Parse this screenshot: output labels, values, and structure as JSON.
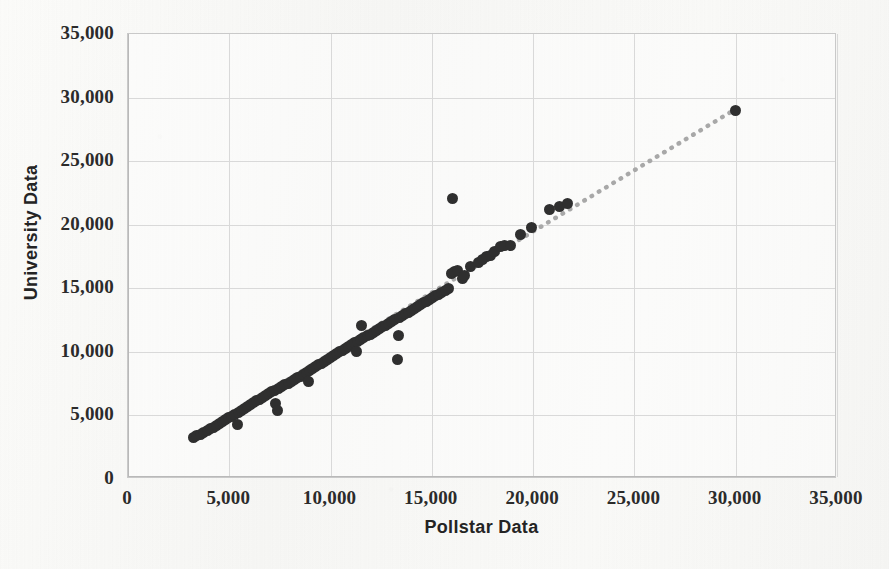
{
  "chart_data": {
    "type": "scatter",
    "title": "",
    "xlabel": "Pollstar Data",
    "ylabel": "University Data",
    "xlim": [
      0,
      35000
    ],
    "ylim": [
      0,
      35000
    ],
    "grid": true,
    "legend": null,
    "xticks": [
      0,
      5000,
      10000,
      15000,
      20000,
      25000,
      30000,
      35000
    ],
    "yticks": [
      0,
      5000,
      10000,
      15000,
      20000,
      25000,
      30000,
      35000
    ],
    "xticklabels": [
      "0",
      "5,000",
      "10,000",
      "15,000",
      "20,000",
      "25,000",
      "30,000",
      "35,000"
    ],
    "yticklabels": [
      "0",
      "5,000",
      "10,000",
      "15,000",
      "20,000",
      "25,000",
      "30,000",
      "35,000"
    ],
    "marker_color": "#2f2f2f",
    "marker_size": 11,
    "trendline": {
      "style": "dotted",
      "color": "#a8a8a8",
      "x": [
        3200,
        30000
      ],
      "y": [
        3200,
        29000
      ]
    },
    "points": [
      [
        3250,
        3300
      ],
      [
        3400,
        3400
      ],
      [
        3600,
        3500
      ],
      [
        3750,
        3650
      ],
      [
        3900,
        3800
      ],
      [
        4050,
        3950
      ],
      [
        4200,
        4050
      ],
      [
        4350,
        4200
      ],
      [
        4500,
        4350
      ],
      [
        4650,
        4500
      ],
      [
        4800,
        4650
      ],
      [
        4950,
        4800
      ],
      [
        5100,
        4950
      ],
      [
        5250,
        5050
      ],
      [
        5400,
        4300
      ],
      [
        5450,
        5250
      ],
      [
        5600,
        5400
      ],
      [
        5750,
        5550
      ],
      [
        5900,
        5700
      ],
      [
        6050,
        5850
      ],
      [
        6200,
        6000
      ],
      [
        6350,
        6150
      ],
      [
        6500,
        6250
      ],
      [
        6650,
        6400
      ],
      [
        6800,
        6550
      ],
      [
        6950,
        6700
      ],
      [
        7100,
        6850
      ],
      [
        7250,
        7000
      ],
      [
        7300,
        5900
      ],
      [
        7400,
        5400
      ],
      [
        7450,
        7150
      ],
      [
        7600,
        7250
      ],
      [
        7750,
        7400
      ],
      [
        7900,
        7550
      ],
      [
        8050,
        7700
      ],
      [
        8200,
        7850
      ],
      [
        8350,
        8000
      ],
      [
        8500,
        8100
      ],
      [
        8650,
        8250
      ],
      [
        8800,
        8400
      ],
      [
        8900,
        7700
      ],
      [
        8950,
        8550
      ],
      [
        9100,
        8700
      ],
      [
        9250,
        8850
      ],
      [
        9400,
        9000
      ],
      [
        9550,
        9100
      ],
      [
        9700,
        9250
      ],
      [
        9850,
        9400
      ],
      [
        10000,
        9550
      ],
      [
        10150,
        9700
      ],
      [
        10300,
        9850
      ],
      [
        10450,
        10000
      ],
      [
        10600,
        10100
      ],
      [
        10750,
        10250
      ],
      [
        10900,
        10400
      ],
      [
        11050,
        10550
      ],
      [
        11200,
        10700
      ],
      [
        11300,
        10050
      ],
      [
        11350,
        10850
      ],
      [
        11500,
        11000
      ],
      [
        11550,
        12100
      ],
      [
        11650,
        11100
      ],
      [
        11800,
        11250
      ],
      [
        11950,
        11400
      ],
      [
        12100,
        11550
      ],
      [
        12250,
        11700
      ],
      [
        12400,
        11850
      ],
      [
        12550,
        12000
      ],
      [
        12700,
        12100
      ],
      [
        12850,
        12250
      ],
      [
        13000,
        12400
      ],
      [
        13150,
        12550
      ],
      [
        13300,
        9400
      ],
      [
        13350,
        11300
      ],
      [
        13400,
        12700
      ],
      [
        13550,
        12850
      ],
      [
        13700,
        13000
      ],
      [
        13850,
        13100
      ],
      [
        14000,
        13250
      ],
      [
        14150,
        13400
      ],
      [
        14300,
        13550
      ],
      [
        14450,
        13700
      ],
      [
        14600,
        13850
      ],
      [
        14750,
        14000
      ],
      [
        14900,
        14100
      ],
      [
        15050,
        14250
      ],
      [
        15200,
        14400
      ],
      [
        15350,
        14550
      ],
      [
        15500,
        14700
      ],
      [
        15650,
        14850
      ],
      [
        15800,
        15000
      ],
      [
        15950,
        16200
      ],
      [
        16000,
        22100
      ],
      [
        16100,
        16300
      ],
      [
        16250,
        16400
      ],
      [
        16500,
        15800
      ],
      [
        16600,
        16000
      ],
      [
        16900,
        16700
      ],
      [
        17300,
        17000
      ],
      [
        17500,
        17300
      ],
      [
        17700,
        17500
      ],
      [
        17900,
        17600
      ],
      [
        18100,
        17900
      ],
      [
        18400,
        18300
      ],
      [
        18600,
        18400
      ],
      [
        18900,
        18400
      ],
      [
        19400,
        19200
      ],
      [
        19900,
        19800
      ],
      [
        20800,
        21200
      ],
      [
        21300,
        21400
      ],
      [
        21700,
        21700
      ],
      [
        30000,
        29000
      ]
    ]
  }
}
